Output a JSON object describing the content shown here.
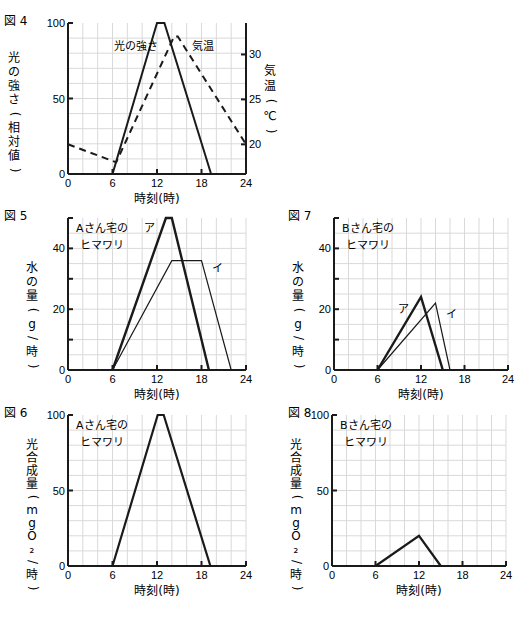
{
  "chart_data": [
    {
      "id": "fig4",
      "figure_label": "図 4",
      "type": "line",
      "frame": {
        "x0": 68,
        "x1": 246,
        "y0": 23,
        "y1": 174
      },
      "xlabel": "時刻(時)",
      "xlim": [
        0,
        24
      ],
      "xticks": [
        0,
        6,
        12,
        18,
        24
      ],
      "ylabel": "光の強さ(相対値)",
      "ylim": [
        0,
        100
      ],
      "yticks": [
        0,
        50,
        100
      ],
      "y2label": "気温(℃)",
      "y2lim": [
        16.7,
        33.5
      ],
      "y2ticks": [
        20,
        25,
        30
      ],
      "grid": true,
      "series": [
        {
          "name": "光の強さ",
          "axis": "left",
          "style": "solid",
          "width": 2,
          "x": [
            6,
            12,
            13,
            19.3
          ],
          "y": [
            0,
            100,
            100,
            0
          ],
          "label_pos": {
            "x": 114,
            "y": 50
          }
        },
        {
          "name": "気温",
          "axis": "right",
          "style": "dashed",
          "width": 2,
          "x": [
            0,
            6.5,
            14.3,
            14.8,
            24
          ],
          "y": [
            20,
            18,
            32,
            32,
            20
          ],
          "label_pos": {
            "x": 192,
            "y": 50
          }
        }
      ]
    },
    {
      "id": "fig5",
      "figure_label": "図 5",
      "type": "line",
      "frame": {
        "x0": 68,
        "x1": 246,
        "y0": 218,
        "y1": 370
      },
      "title": [
        "Aさん宅の",
        "ヒマワリ"
      ],
      "xlabel": "時刻(時)",
      "xlim": [
        0,
        24
      ],
      "xticks": [
        0,
        6,
        12,
        18,
        24
      ],
      "ylabel": "水の量(g/時)",
      "ylim": [
        0,
        50
      ],
      "yticks": [
        0,
        20,
        40
      ],
      "yminor": [
        10,
        30
      ],
      "grid": true,
      "series": [
        {
          "name": "ア",
          "style": "solid",
          "width": 2.4,
          "x": [
            6,
            13.2,
            14,
            19
          ],
          "y": [
            0,
            50,
            50,
            0
          ],
          "label_pos": {
            "x": 144,
            "y": 232
          }
        },
        {
          "name": "イ",
          "style": "solid",
          "width": 1.2,
          "x": [
            6,
            14,
            18,
            22
          ],
          "y": [
            0,
            36,
            36,
            0
          ],
          "label_pos": {
            "x": 212,
            "y": 272
          }
        }
      ]
    },
    {
      "id": "fig7",
      "figure_label": "図 7",
      "type": "line",
      "frame": {
        "x0": 334,
        "x1": 508,
        "y0": 218,
        "y1": 370
      },
      "title": [
        "Bさん宅の",
        "ヒマワリ"
      ],
      "xlabel": "時刻(時)",
      "xlim": [
        0,
        24
      ],
      "xticks": [
        0,
        6,
        12,
        18,
        24
      ],
      "ylabel": "水の量(g/時)",
      "ylim": [
        0,
        50
      ],
      "yticks": [
        0,
        20,
        40
      ],
      "yminor": [
        10,
        30
      ],
      "grid": true,
      "series": [
        {
          "name": "ア",
          "style": "solid",
          "width": 2.4,
          "x": [
            6,
            12,
            15
          ],
          "y": [
            0,
            24,
            0
          ],
          "label_pos": {
            "x": 398,
            "y": 313
          }
        },
        {
          "name": "イ",
          "style": "solid",
          "width": 1.2,
          "x": [
            6,
            14,
            16
          ],
          "y": [
            0,
            22,
            0
          ],
          "label_pos": {
            "x": 446,
            "y": 318
          }
        }
      ]
    },
    {
      "id": "fig6",
      "figure_label": "図 6",
      "type": "line",
      "frame": {
        "x0": 68,
        "x1": 246,
        "y0": 415,
        "y1": 566
      },
      "title": [
        "Aさん宅の",
        "ヒマワリ"
      ],
      "xlabel": "時刻(時)",
      "xlim": [
        0,
        24
      ],
      "xticks": [
        0,
        6,
        12,
        18,
        24
      ],
      "ylabel": "光合成量(mgO₂/時)",
      "ylim": [
        0,
        100
      ],
      "yticks": [
        0,
        50,
        100
      ],
      "grid": true,
      "series": [
        {
          "name": "光合成量",
          "style": "solid",
          "width": 2.2,
          "x": [
            6,
            12.1,
            12.9,
            19.2
          ],
          "y": [
            0,
            100,
            100,
            0
          ]
        }
      ]
    },
    {
      "id": "fig8",
      "figure_label": "図 8",
      "type": "line",
      "frame": {
        "x0": 332,
        "x1": 506,
        "y0": 415,
        "y1": 566
      },
      "title": [
        "Bさん宅の",
        "ヒマワリ"
      ],
      "xlabel": "時刻(時)",
      "xlim": [
        0,
        24
      ],
      "xticks": [
        0,
        6,
        12,
        18,
        24
      ],
      "ylabel": "光合成量(mgO₂/時)",
      "ylim": [
        0,
        100
      ],
      "yticks": [
        0,
        50,
        100
      ],
      "grid": true,
      "series": [
        {
          "name": "光合成量",
          "style": "solid",
          "width": 2.2,
          "x": [
            6,
            12,
            15
          ],
          "y": [
            0,
            20,
            0
          ]
        }
      ]
    }
  ],
  "layout": {
    "figure_label_positions": {
      "fig4": {
        "x": 4,
        "y": 21
      },
      "fig5": {
        "x": 4,
        "y": 216
      },
      "fig7": {
        "x": 288,
        "y": 216
      },
      "fig6": {
        "x": 4,
        "y": 413
      },
      "fig8": {
        "x": 288,
        "y": 413
      }
    }
  },
  "colors": {
    "line": "#1a1a1a",
    "grid": "#d9d9d9",
    "axis": "#1a1a1a"
  }
}
